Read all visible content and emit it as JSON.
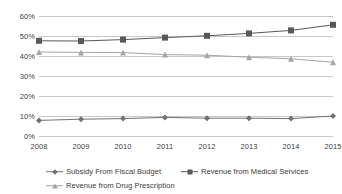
{
  "chart_data": {
    "type": "line",
    "title": "",
    "xlabel": "",
    "ylabel": "",
    "categories": [
      "2008",
      "2009",
      "2010",
      "2011",
      "2012",
      "2013",
      "2014",
      "2015"
    ],
    "ylim": [
      0,
      60
    ],
    "ytick_labels": [
      "0%",
      "10%",
      "20%",
      "30%",
      "40%",
      "50%",
      "60%"
    ],
    "ytick_values": [
      0,
      10,
      20,
      30,
      40,
      50,
      60
    ],
    "grid": true,
    "legend_position": "bottom",
    "series": [
      {
        "name": "Subsidy From Fiscal Budget",
        "values": [
          7.8,
          8.4,
          8.7,
          9.3,
          8.9,
          8.9,
          8.7,
          10.0
        ],
        "color": "#767171",
        "marker": "diamond"
      },
      {
        "name": "Revenue from Medical Services",
        "values": [
          47.6,
          47.5,
          48.2,
          49.2,
          50.1,
          51.3,
          52.8,
          55.6
        ],
        "color": "#595959",
        "marker": "square"
      },
      {
        "name": "Revenue from Drug Prescription",
        "values": [
          42.0,
          41.8,
          41.7,
          40.7,
          40.4,
          39.4,
          38.6,
          36.9
        ],
        "color": "#a6a6a6",
        "marker": "triangle"
      }
    ]
  }
}
